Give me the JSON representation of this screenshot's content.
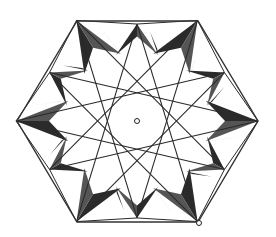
{
  "figure": {
    "center": [
      137,
      121
    ],
    "hexagon": {
      "vertices": [
        [
          77,
          21
        ],
        [
          198,
          21
        ],
        [
          258,
          121
        ],
        [
          198,
          222
        ],
        [
          77,
          222
        ],
        [
          17,
          121
        ]
      ],
      "stroke": "#333333"
    },
    "star": {
      "points": 12,
      "outer_radius": 100,
      "inner_radius": 80,
      "step": 5,
      "stroke": "#2a2a2a"
    },
    "shading": {
      "dark": "#2b2b2b",
      "mid": "#555555"
    },
    "markers": [
      {
        "name": "center-point",
        "x": 137,
        "y": 121,
        "r": 2.5
      },
      {
        "name": "vertex-point",
        "x": 199,
        "y": 223,
        "r": 2.5
      }
    ]
  }
}
